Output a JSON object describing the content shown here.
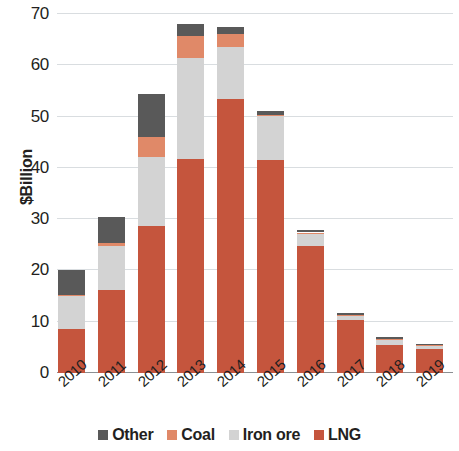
{
  "chart_data": {
    "type": "bar",
    "subtype": "stacked-bar",
    "title": "",
    "subtitle": "",
    "xlabel": "",
    "ylabel": "$Billion",
    "ylim": [
      0,
      70
    ],
    "yticks": [
      0,
      10,
      20,
      30,
      40,
      50,
      60,
      70
    ],
    "ytick_labels": [
      "0",
      "10",
      "20",
      "30",
      "40",
      "50",
      "60",
      "70"
    ],
    "grid": true,
    "grid_axis": "y",
    "legend_position": "bottom",
    "categories": [
      "2010",
      "2011",
      "2012",
      "2013",
      "2014",
      "2015",
      "2016",
      "2017",
      "2018",
      "2019"
    ],
    "series": [
      {
        "name": "LNG",
        "color": "#C5553D",
        "values": [
          8.5,
          16.2,
          28.6,
          41.8,
          53.4,
          41.5,
          24.8,
          10.4,
          5.4,
          4.6
        ]
      },
      {
        "name": "Iron ore",
        "color": "#D3D3D3",
        "values": [
          6.6,
          8.5,
          13.6,
          19.6,
          10.2,
          8.6,
          2.4,
          0.9,
          1.2,
          0.7
        ]
      },
      {
        "name": "Coal",
        "color": "#E08968",
        "values": [
          0.2,
          0.7,
          3.9,
          4.4,
          2.6,
          0.3,
          0.2,
          0.1,
          0.1,
          0.1
        ]
      },
      {
        "name": "Other",
        "color": "#595959",
        "values": [
          4.7,
          5.1,
          8.4,
          2.2,
          1.3,
          0.7,
          0.4,
          0.4,
          0.4,
          0.2
        ]
      }
    ],
    "totals": [
      20.0,
      30.5,
      54.5,
      68.0,
      67.5,
      51.1,
      27.8,
      11.8,
      7.1,
      5.6
    ],
    "stack_order": [
      "LNG",
      "Iron ore",
      "Coal",
      "Other"
    ]
  },
  "legend": {
    "items": [
      {
        "label": "Other",
        "color": "#595959",
        "swatch": "legend-swatch-other"
      },
      {
        "label": "Coal",
        "color": "#E08968",
        "swatch": "legend-swatch-coal"
      },
      {
        "label": "Iron ore",
        "color": "#D3D3D3",
        "swatch": "legend-swatch-iron-ore"
      },
      {
        "label": "LNG",
        "color": "#C5553D",
        "swatch": "legend-swatch-lng"
      }
    ]
  },
  "axes": {
    "y_title": "$Billion",
    "y_tick_labels": [
      "70",
      "60",
      "50",
      "40",
      "30",
      "20",
      "10",
      "0"
    ],
    "x_tick_labels": [
      "2010",
      "2011",
      "2012",
      "2013",
      "2014",
      "2015",
      "2016",
      "2017",
      "2018",
      "2019"
    ]
  },
  "colors": {
    "other": "#595959",
    "coal": "#E08968",
    "iron_ore": "#D3D3D3",
    "lng": "#C5553D",
    "gridline": "#d9dde0",
    "axis": "#8b8f92",
    "text": "#231f20",
    "background": "#ffffff"
  }
}
